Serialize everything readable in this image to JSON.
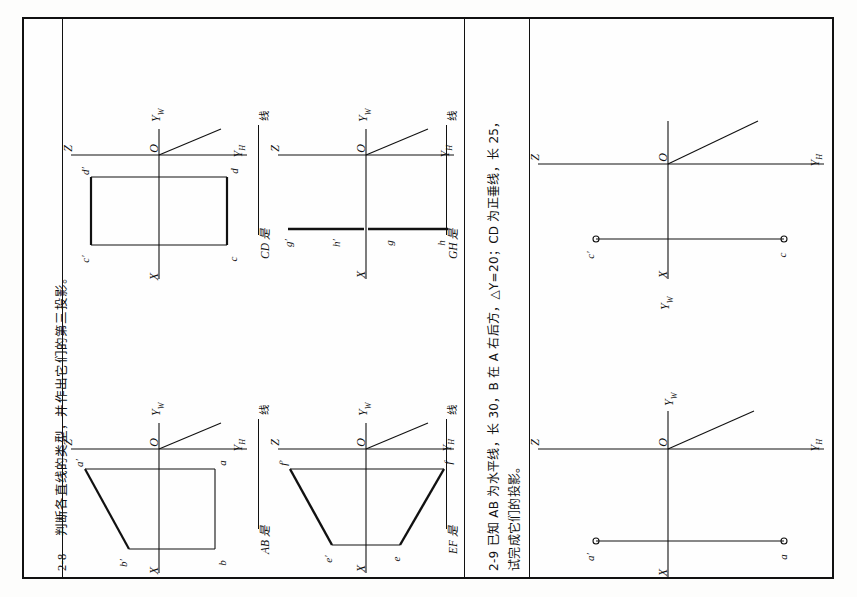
{
  "page": {
    "orientation": "rotated-90-ccw",
    "background": "#fdfdfc",
    "ink": "#111111"
  },
  "questions": [
    {
      "id": "2-8",
      "number": "2-8",
      "text": "判断各直线的类型，并作出它们的第三投影。"
    },
    {
      "id": "2-9",
      "number": "2-9",
      "text": "已知 AB 为水平线，长 30，B 在 A 右后方，△Y=20；CD 为正垂线，长 25，D 在 C 之后，试完成它们的投影。",
      "line1": "2-9  已知 AB 为水平线，长 30，B 在 A 右后方，△Y=20；CD 为正垂线，长 25，",
      "line2": "试完成它们的投影。"
    }
  ],
  "answers": [
    {
      "id": "AB",
      "prompt": "AB 是",
      "suffix": "线",
      "value": ""
    },
    {
      "id": "EF",
      "prompt": "EF 是",
      "suffix": "线",
      "value": ""
    },
    {
      "id": "CD",
      "prompt": "CD 是",
      "suffix": "线",
      "value": ""
    },
    {
      "id": "GH",
      "prompt": "GH 是",
      "suffix": "线",
      "value": ""
    }
  ],
  "axes": {
    "z": "Z",
    "x": "X",
    "yw": "Y",
    "yw_sub": "W",
    "yh": "Y",
    "yh_sub": "H",
    "origin": "O"
  },
  "diagrams": [
    {
      "id": "ab",
      "name": "diagram-AB",
      "caption": "AB",
      "points": [
        {
          "label": "a′",
          "pos": "upper-left"
        },
        {
          "label": "b′",
          "pos": "lower-left"
        },
        {
          "label": "a",
          "pos": "upper-right"
        },
        {
          "label": "b",
          "pos": "lower-right"
        }
      ],
      "shape": "quadrilateral with bold a′b′ edge"
    },
    {
      "id": "ef",
      "name": "diagram-EF",
      "caption": "EF",
      "points": [
        {
          "label": "f′",
          "pos": "upper-left"
        },
        {
          "label": "e′",
          "pos": "lower-left"
        },
        {
          "label": "f",
          "pos": "upper-right"
        },
        {
          "label": "e",
          "pos": "lower-right"
        }
      ],
      "shape": "trapezoid with bold slanted legs"
    },
    {
      "id": "cd",
      "name": "diagram-CD",
      "caption": "CD",
      "points": [
        {
          "label": "d′",
          "pos": "upper-left"
        },
        {
          "label": "c′",
          "pos": "lower-left"
        },
        {
          "label": "d",
          "pos": "upper-right"
        },
        {
          "label": "c",
          "pos": "lower-right"
        }
      ],
      "shape": "rectangle with bold left and right edges"
    },
    {
      "id": "gh",
      "name": "diagram-GH",
      "caption": "GH",
      "points": [
        {
          "label": "g′",
          "pos": "far-left"
        },
        {
          "label": "h′",
          "pos": "mid-left"
        },
        {
          "label": "g",
          "pos": "mid-right"
        },
        {
          "label": "h",
          "pos": "far-right"
        }
      ],
      "shape": "two collinear bold segments on one horizontal line"
    },
    {
      "id": "a-given",
      "name": "diagram-A-given",
      "caption": "A",
      "points": [
        {
          "label": "a′",
          "pos": "left-endpoint-circle"
        },
        {
          "label": "a",
          "pos": "right-endpoint-circle"
        }
      ],
      "shape": "thin horizontal line with open circle markers at both ends"
    },
    {
      "id": "c-given",
      "name": "diagram-C-given",
      "caption": "C",
      "points": [
        {
          "label": "c′",
          "pos": "left-endpoint-circle"
        },
        {
          "label": "c",
          "pos": "right-endpoint-circle"
        }
      ],
      "shape": "thin horizontal line with open circle markers at both ends"
    }
  ]
}
